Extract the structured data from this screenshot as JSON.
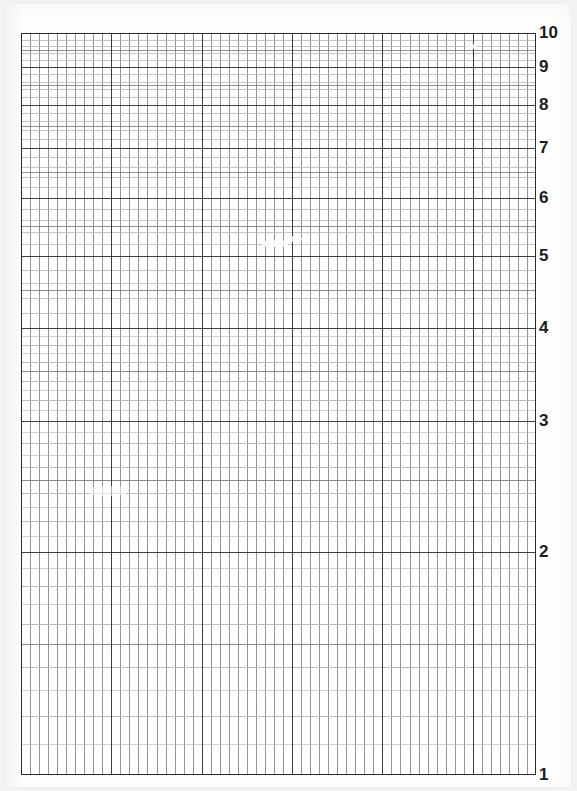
{
  "sheet": {
    "title": "Semi-logarithmic graph paper",
    "paper_color": "#fefefe",
    "background_color": "#f2f2f1",
    "grid": {
      "left": 21,
      "top": 33,
      "width": 515,
      "height": 742
    }
  },
  "chart_data": {
    "type": "grid",
    "title": "",
    "subtitle": "",
    "xlabel": "",
    "ylabel": "",
    "grid": "on",
    "legend": "none",
    "series": [],
    "x_axis": {
      "scale": "linear",
      "tick_labels": [],
      "minor_divisions": 57,
      "major_every": 10,
      "major_line_color": "#2b2b2b",
      "minor_line_color": "#7d7d7d"
    },
    "y_axis": {
      "scale": "log",
      "base": 10,
      "cycles": 1,
      "ylim": [
        1,
        10
      ],
      "decade_start": 1,
      "decade_end": 10,
      "tick_labels": [
        "1",
        "2",
        "3",
        "4",
        "5",
        "6",
        "7",
        "8",
        "9",
        "10"
      ],
      "tick_values": [
        1,
        2,
        3,
        4,
        5,
        6,
        7,
        8,
        9,
        10
      ],
      "subdivisions_per_decade": 10,
      "sub_subdivisions": 5,
      "major_line_color": "#2b2b2b",
      "minor_line_color": "#7d7d7d",
      "fine_line_color": "#b4b4b4"
    },
    "label_positions_px": {
      "10": 33,
      "9": 71,
      "8": 113,
      "7": 160,
      "6": 198,
      "5": 257,
      "4": 330,
      "3": 421,
      "2": 550,
      "1": 775
    }
  },
  "axis_labels": [
    {
      "text": "10",
      "value": 10
    },
    {
      "text": "9",
      "value": 9
    },
    {
      "text": "8",
      "value": 8
    },
    {
      "text": "7",
      "value": 7
    },
    {
      "text": "6",
      "value": 6
    },
    {
      "text": "5",
      "value": 5
    },
    {
      "text": "4",
      "value": 4
    },
    {
      "text": "3",
      "value": 3
    },
    {
      "text": "2",
      "value": 2
    },
    {
      "text": "1",
      "value": 1
    }
  ]
}
